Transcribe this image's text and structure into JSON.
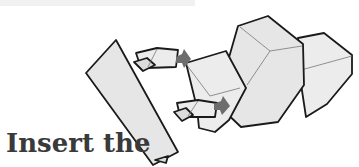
{
  "caption": {
    "text": "Insert the"
  },
  "diagram": {
    "colors": {
      "paper_fill": "#e6e6e6",
      "outline": "#1a1a1a",
      "arrow": "#6d6d6d",
      "text": "#3a3a3a"
    },
    "arrows": [
      {
        "name": "upper-insert-arrow",
        "direction": "right"
      },
      {
        "name": "lower-insert-arrow",
        "direction": "right"
      }
    ]
  }
}
